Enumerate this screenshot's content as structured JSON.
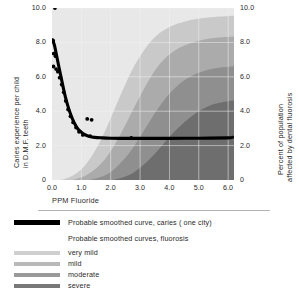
{
  "chart_data": {
    "type": "line",
    "title": "",
    "xlabel": "PPM Fluoride",
    "ylabel_left": "Caries experience per child in D.M.F. teeth",
    "ylabel_left_line1": "Caries experience per child",
    "ylabel_left_line2": "in D.M.F. teeth",
    "ylabel_right": "Percent of population affected by dental fluorosis",
    "ylabel_right_line1": "Percent of population",
    "ylabel_right_line2": "affected by dental fluorosis",
    "xlim": [
      0.0,
      6.2
    ],
    "ylim_left": [
      0.0,
      10.0
    ],
    "ylim_right": [
      0.0,
      10.0
    ],
    "grid": true,
    "legend_position": "below",
    "xticks": [
      "0.0",
      "1.0",
      "2.0",
      "3.0",
      "4.0",
      "5.0",
      "6.0"
    ],
    "xtick_values": [
      0.0,
      1.0,
      2.0,
      3.0,
      4.0,
      5.0,
      6.0
    ],
    "yticks_left": [
      "0",
      "2.0",
      "4.0",
      "6.0",
      "8.0",
      "10.0"
    ],
    "ytick_values_left": [
      0.0,
      2.0,
      4.0,
      6.0,
      8.0,
      10.0
    ],
    "yticks_right": [
      "0",
      "2.0",
      "4.0",
      "6.0",
      "8.0",
      "10.0"
    ],
    "ytick_values_right": [
      0.0,
      2.0,
      4.0,
      6.0,
      8.0,
      10.0
    ],
    "series": [
      {
        "name": "Probable smoothed curve, caries ( one city)",
        "type": "line",
        "axis": "left",
        "color": "#000000",
        "points": [
          [
            0.02,
            8.15
          ],
          [
            0.08,
            7.85
          ],
          [
            0.15,
            7.3
          ],
          [
            0.22,
            6.7
          ],
          [
            0.3,
            6.05
          ],
          [
            0.38,
            5.4
          ],
          [
            0.46,
            4.8
          ],
          [
            0.55,
            4.25
          ],
          [
            0.65,
            3.75
          ],
          [
            0.75,
            3.35
          ],
          [
            0.85,
            3.05
          ],
          [
            0.95,
            2.85
          ],
          [
            1.1,
            2.65
          ],
          [
            1.25,
            2.55
          ],
          [
            1.45,
            2.48
          ],
          [
            1.7,
            2.45
          ],
          [
            2.0,
            2.43
          ],
          [
            2.5,
            2.42
          ],
          [
            3.0,
            2.42
          ],
          [
            4.0,
            2.42
          ],
          [
            5.0,
            2.43
          ],
          [
            6.0,
            2.45
          ],
          [
            6.15,
            2.48
          ]
        ]
      },
      {
        "name": "caries observations",
        "type": "scatter",
        "axis": "left",
        "color": "#000000",
        "points": [
          [
            0.1,
            10.0
          ],
          [
            0.04,
            8.1
          ],
          [
            0.06,
            7.35
          ],
          [
            0.05,
            6.6
          ],
          [
            0.12,
            7.2
          ],
          [
            0.14,
            6.45
          ],
          [
            0.2,
            6.3
          ],
          [
            0.26,
            5.95
          ],
          [
            0.33,
            5.55
          ],
          [
            0.4,
            5.1
          ],
          [
            0.47,
            4.6
          ],
          [
            0.55,
            4.1
          ],
          [
            0.63,
            3.7
          ],
          [
            0.72,
            3.35
          ],
          [
            0.82,
            3.05
          ],
          [
            0.92,
            2.8
          ],
          [
            1.05,
            2.62
          ],
          [
            1.2,
            3.55
          ],
          [
            1.35,
            3.5
          ],
          [
            1.3,
            2.55
          ],
          [
            2.7,
            2.45
          ]
        ]
      }
    ],
    "fluorosis_bands": [
      {
        "name": "very mild",
        "color": "#c9c9c9",
        "description": "lightest band, onset near 0.4 PPM rising to plateau ~9.2 at 4.5 PPM",
        "curve": [
          [
            0.3,
            0.0
          ],
          [
            0.7,
            0.25
          ],
          [
            1.1,
            0.8
          ],
          [
            1.5,
            1.8
          ],
          [
            1.9,
            3.2
          ],
          [
            2.3,
            4.8
          ],
          [
            2.7,
            6.3
          ],
          [
            3.1,
            7.45
          ],
          [
            3.5,
            8.3
          ],
          [
            4.0,
            8.9
          ],
          [
            4.6,
            9.25
          ],
          [
            5.3,
            9.45
          ],
          [
            6.2,
            9.55
          ]
        ]
      },
      {
        "name": "mild",
        "color": "#ababab",
        "description": "second band, onset near 0.9 PPM rising to plateau ~8.1 at 5.0 PPM",
        "curve": [
          [
            0.7,
            0.0
          ],
          [
            1.2,
            0.3
          ],
          [
            1.7,
            1.0
          ],
          [
            2.1,
            1.95
          ],
          [
            2.5,
            3.2
          ],
          [
            2.9,
            4.55
          ],
          [
            3.3,
            5.8
          ],
          [
            3.7,
            6.8
          ],
          [
            4.2,
            7.55
          ],
          [
            4.8,
            8.0
          ],
          [
            5.5,
            8.25
          ],
          [
            6.2,
            8.35
          ]
        ]
      },
      {
        "name": "moderate",
        "color": "#8f8f8f",
        "description": "third band, onset near 1.5 PPM rising to plateau ~6.6 at 5.5 PPM",
        "curve": [
          [
            1.3,
            0.0
          ],
          [
            1.9,
            0.35
          ],
          [
            2.4,
            1.1
          ],
          [
            2.85,
            2.1
          ],
          [
            3.25,
            3.2
          ],
          [
            3.65,
            4.25
          ],
          [
            4.1,
            5.2
          ],
          [
            4.6,
            5.9
          ],
          [
            5.2,
            6.35
          ],
          [
            5.8,
            6.55
          ],
          [
            6.2,
            6.62
          ]
        ]
      },
      {
        "name": "severe",
        "color": "#6e6e6e",
        "description": "darkest band, onset near 2.3 PPM rising to plateau ~4.6 at 6.0 PPM",
        "curve": [
          [
            2.1,
            0.0
          ],
          [
            2.7,
            0.35
          ],
          [
            3.2,
            1.0
          ],
          [
            3.65,
            1.8
          ],
          [
            4.05,
            2.6
          ],
          [
            4.5,
            3.35
          ],
          [
            5.0,
            4.0
          ],
          [
            5.5,
            4.4
          ],
          [
            6.0,
            4.58
          ],
          [
            6.2,
            4.62
          ]
        ]
      }
    ],
    "plot_background": "#e8e8e8",
    "gridline_color": "#f4f4f4"
  },
  "legend": {
    "caries_label": "Probable smoothed curve, caries ( one city)",
    "fluorosis_header": "Probable smoothed curves, fluorosis",
    "bands": [
      {
        "label": "very mild",
        "color": "#cfcfcf"
      },
      {
        "label": "mild",
        "color": "#b9b9b9"
      },
      {
        "label": "moderate",
        "color": "#9a9a9a"
      },
      {
        "label": "severe",
        "color": "#787878"
      }
    ]
  }
}
